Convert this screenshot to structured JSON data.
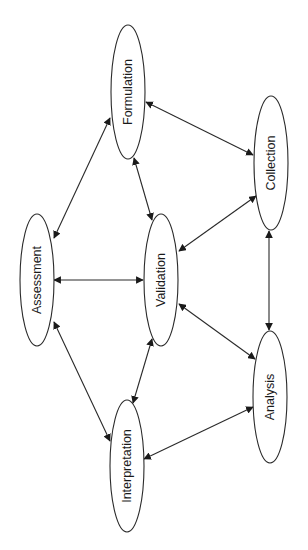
{
  "diagram": {
    "type": "bidirectional process cycle",
    "rotation_deg": -90,
    "colors": {
      "stroke": "#2a2a2a",
      "text": "#1a1a1a",
      "background": "#ffffff"
    },
    "nodes": [
      {
        "id": "formulation",
        "label": "Formulation",
        "cx": 128,
        "cy": 92,
        "rx": 17,
        "ry": 67
      },
      {
        "id": "collection",
        "label": "Collection",
        "cx": 271,
        "cy": 163,
        "rx": 17,
        "ry": 67
      },
      {
        "id": "assessment",
        "label": "Assessment",
        "cx": 37,
        "cy": 280,
        "rx": 17,
        "ry": 66
      },
      {
        "id": "validation",
        "label": "Validation",
        "cx": 161,
        "cy": 280,
        "rx": 17,
        "ry": 66
      },
      {
        "id": "analysis",
        "label": "Analysis",
        "cx": 270,
        "cy": 397,
        "rx": 17,
        "ry": 66
      },
      {
        "id": "interpretation",
        "label": "Interpretation",
        "cx": 127,
        "cy": 466,
        "rx": 17,
        "ry": 66
      }
    ],
    "edges": [
      {
        "from": "formulation",
        "to": "collection",
        "bidirectional": true,
        "x1": 146,
        "y1": 102,
        "x2": 253,
        "y2": 155
      },
      {
        "from": "formulation",
        "to": "assessment",
        "bidirectional": true,
        "x1": 110,
        "y1": 118,
        "x2": 54,
        "y2": 238
      },
      {
        "from": "formulation",
        "to": "validation",
        "bidirectional": true,
        "x1": 134,
        "y1": 158,
        "x2": 152,
        "y2": 220
      },
      {
        "from": "collection",
        "to": "validation",
        "bidirectional": true,
        "x1": 256,
        "y1": 196,
        "x2": 179,
        "y2": 251
      },
      {
        "from": "collection",
        "to": "analysis",
        "bidirectional": true,
        "x1": 269,
        "y1": 231,
        "x2": 269,
        "y2": 330
      },
      {
        "from": "assessment",
        "to": "validation",
        "bidirectional": true,
        "x1": 54,
        "y1": 280,
        "x2": 143,
        "y2": 280
      },
      {
        "from": "validation",
        "to": "analysis",
        "bidirectional": true,
        "x1": 179,
        "y1": 304,
        "x2": 255,
        "y2": 359
      },
      {
        "from": "assessment",
        "to": "interpretation",
        "bidirectional": true,
        "x1": 54,
        "y1": 322,
        "x2": 110,
        "y2": 441
      },
      {
        "from": "validation",
        "to": "interpretation",
        "bidirectional": true,
        "x1": 152,
        "y1": 339,
        "x2": 133,
        "y2": 403
      },
      {
        "from": "analysis",
        "to": "interpretation",
        "bidirectional": true,
        "x1": 253,
        "y1": 407,
        "x2": 144,
        "y2": 459
      }
    ]
  }
}
